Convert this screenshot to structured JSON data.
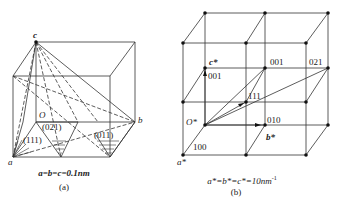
{
  "figure_a": {
    "point_labels": {
      "c": "c",
      "O": "O",
      "b": "b",
      "a": "a"
    },
    "plane_labels": [
      "(111)",
      "(021)",
      "(011)"
    ],
    "equation": "a=b=c=0.1nm",
    "caption": "(a)"
  },
  "figure_b": {
    "node_labels": {
      "c_star": "c*",
      "O_star": "O*",
      "b_star": "b*",
      "a_star": "a*"
    },
    "vector_labels": [
      "001",
      "001",
      "021",
      "111",
      "010",
      "100"
    ],
    "equation": "a*=b*=c*=10nm",
    "equation_sup": "-1",
    "caption": "(b)"
  },
  "colors": {
    "line": "#333333",
    "dot": "#111111",
    "background": "#ffffff"
  }
}
